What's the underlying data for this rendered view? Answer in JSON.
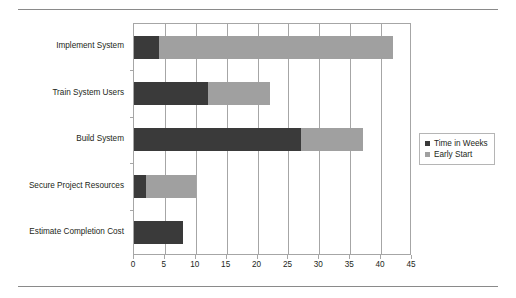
{
  "chart_data": {
    "type": "bar",
    "orientation": "horizontal",
    "stacked": true,
    "title": "",
    "xlabel": "",
    "ylabel": "",
    "categories": [
      "Estimate Completion Cost",
      "Secure Project Resources",
      "Build System",
      "Train System Users",
      "Implement System"
    ],
    "series": [
      {
        "name": "Early Start",
        "values": [
          0,
          2,
          27,
          12,
          4
        ]
      },
      {
        "name": "Time in Weeks",
        "values": [
          8,
          8,
          10,
          10,
          38
        ]
      }
    ],
    "bar_segments": [
      {
        "category": "Estimate Completion Cost",
        "early_start": 0,
        "time_in_weeks": 8,
        "end": 8
      },
      {
        "category": "Secure Project Resources",
        "early_start": 2,
        "time_in_weeks": 8,
        "end": 10
      },
      {
        "category": "Build System",
        "early_start": 27,
        "time_in_weeks": 10,
        "end": 37
      },
      {
        "category": "Train System Users",
        "early_start": 12,
        "time_in_weeks": 10,
        "end": 22
      },
      {
        "category": "Implement System",
        "early_start": 4,
        "time_in_weeks": 38,
        "end": 42
      }
    ],
    "xlim": [
      0,
      45
    ],
    "xticks": [
      0,
      5,
      10,
      15,
      20,
      25,
      30,
      35,
      40,
      45
    ],
    "xtick_labels": [
      "0",
      "5",
      "10",
      "15",
      "20",
      "25",
      "30",
      "35",
      "40",
      "45"
    ],
    "grid": "vertical",
    "legend_position": "right",
    "legend": [
      {
        "label": "Time in Weeks",
        "color": "#3a3a3a"
      },
      {
        "label": "Early Start",
        "color": "#a0a0a0"
      }
    ],
    "colors": {
      "time_in_weeks": "#3a3a3a",
      "early_start": "#a0a0a0",
      "axis": "#a6a6a6",
      "text": "#231f20",
      "background": "#ffffff"
    }
  }
}
